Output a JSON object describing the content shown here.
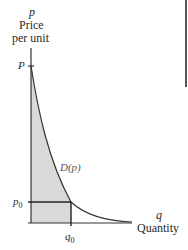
{
  "axes": {
    "y_symbol": "p",
    "y_label_line1": "Price",
    "y_label_line2": "per unit",
    "x_symbol": "q",
    "x_label": "Quantity"
  },
  "ticks": {
    "P": "P",
    "p0": "p",
    "p0_sub": "0",
    "q0": "q",
    "q0_sub": "0"
  },
  "curve_label": "D(p)",
  "colors": {
    "shade": "#d9d9d9",
    "lines": "#333333",
    "text": "#2a2a2a"
  }
}
